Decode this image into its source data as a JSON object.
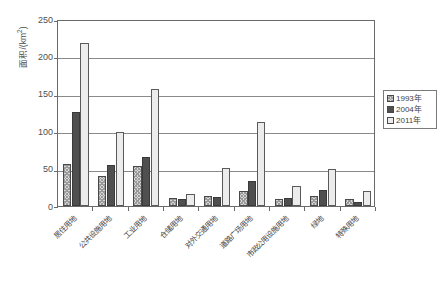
{
  "chart_data": {
    "type": "bar",
    "title": "",
    "xlabel": "",
    "ylabel": "面积/(km²)",
    "ylabel_main": "面积/(km",
    "ylabel_sup": "2",
    "ylabel_tail": ")",
    "ylim": [
      0,
      250
    ],
    "ytick_step": 50,
    "yticks": [
      0,
      50,
      100,
      150,
      200,
      250
    ],
    "ytick_labels": [
      "0",
      "50",
      "100",
      "150",
      "200",
      "250"
    ],
    "grid": true,
    "legend_position": "right",
    "categories": [
      "居住用地",
      "公共设施用地",
      "工业用地",
      "仓储用地",
      "对外交通用地",
      "道路广场用地",
      "市政公用设施用地",
      "绿地",
      "特殊用地"
    ],
    "series": [
      {
        "name": "1993年",
        "color": "#d8d8d8",
        "pattern": "cross-hatch",
        "values": [
          56,
          40,
          53,
          11,
          13,
          20,
          10,
          13,
          9
        ]
      },
      {
        "name": "2004年",
        "color": "#4f4f4f",
        "pattern": "solid",
        "values": [
          126,
          55,
          65,
          9,
          12,
          33,
          11,
          21,
          6
        ]
      },
      {
        "name": "2011年",
        "color": "#ececec",
        "pattern": "solid-light",
        "values": [
          218,
          99,
          157,
          16,
          51,
          112,
          27,
          50,
          20
        ]
      }
    ]
  },
  "legend": {
    "items": [
      {
        "label": "1993年"
      },
      {
        "label": "2004年"
      },
      {
        "label": "2011年"
      }
    ]
  }
}
